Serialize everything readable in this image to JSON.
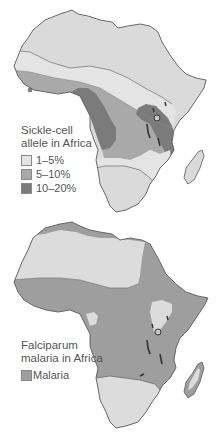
{
  "maps": [
    {
      "title": "Sickle-cell allele in Africa",
      "title_lines": [
        "Sickle-cell",
        "allele in Africa"
      ],
      "legend": [
        {
          "label": "1–5%",
          "color": "#e4e4e4"
        },
        {
          "label": "5–10%",
          "color": "#a9a9a9"
        },
        {
          "label": "10–20%",
          "color": "#7b7b7b"
        }
      ],
      "base_color": "#dadada"
    },
    {
      "title": "Falciparum malaria in Africa",
      "title_lines": [
        "Falciparum",
        "malaria in Africa"
      ],
      "legend": [
        {
          "label": "Malaria",
          "color": "#9e9e9e"
        }
      ],
      "base_color": "#dcdcdc"
    }
  ],
  "colors": {
    "outline": "#5a5a5a",
    "lake": "#333333"
  }
}
